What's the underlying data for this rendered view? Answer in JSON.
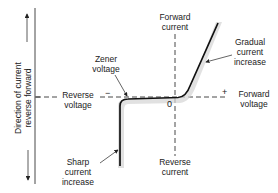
{
  "diagram": {
    "axis_side_label": {
      "line1": "Direction of current",
      "line2": "reverse forward"
    },
    "labels": {
      "forward_current": [
        "Forward",
        "current"
      ],
      "reverse_current": [
        "Reverse",
        "current"
      ],
      "forward_voltage": [
        "Forward",
        "voltage"
      ],
      "reverse_voltage": [
        "Reverse",
        "voltage"
      ],
      "zener_voltage": [
        "Zener",
        "voltage"
      ],
      "gradual_increase": [
        "Gradual",
        "current",
        "increase"
      ],
      "sharp_increase": [
        "Sharp",
        "current",
        "increase"
      ]
    },
    "symbols": {
      "minus": "−",
      "plus": "+",
      "origin": "0"
    },
    "colors": {
      "line": "#111111",
      "shading": "#c8c8c8",
      "text": "#222222"
    }
  }
}
